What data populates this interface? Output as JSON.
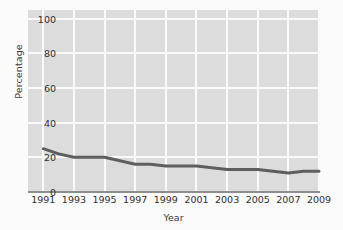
{
  "chart_data": {
    "type": "line",
    "title": "",
    "xlabel": "Year",
    "ylabel": "Percentage",
    "x": [
      1991,
      1992,
      1993,
      1994,
      1995,
      1996,
      1997,
      1998,
      1999,
      2000,
      2001,
      2002,
      2003,
      2004,
      2005,
      2006,
      2007,
      2008,
      2009
    ],
    "series": [
      {
        "name": "Percentage",
        "color": "#5e5e5e",
        "values": [
          25,
          22,
          20,
          20,
          20,
          18,
          16,
          16,
          15,
          15,
          15,
          14,
          13,
          13,
          13,
          12,
          11,
          12,
          12
        ]
      }
    ],
    "x_tick_labels": [
      "1991",
      "1993",
      "1995",
      "1997",
      "1999",
      "2001",
      "2003",
      "2005",
      "2007",
      "2009"
    ],
    "x_tick_values": [
      1991,
      1993,
      1995,
      1997,
      1999,
      2001,
      2003,
      2005,
      2007,
      2009
    ],
    "y_tick_labels": [
      "0",
      "20",
      "40",
      "60",
      "80",
      "100"
    ],
    "y_tick_values": [
      0,
      20,
      40,
      60,
      80,
      100
    ],
    "xlim": [
      1990,
      2009
    ],
    "ylim": [
      0,
      105
    ],
    "grid": true,
    "legend": false,
    "plot_background": "#dcdcdc",
    "grid_color": "#fafafa",
    "page_background": "#fbfbfb",
    "axis_line_color": "#8e8e8e"
  }
}
